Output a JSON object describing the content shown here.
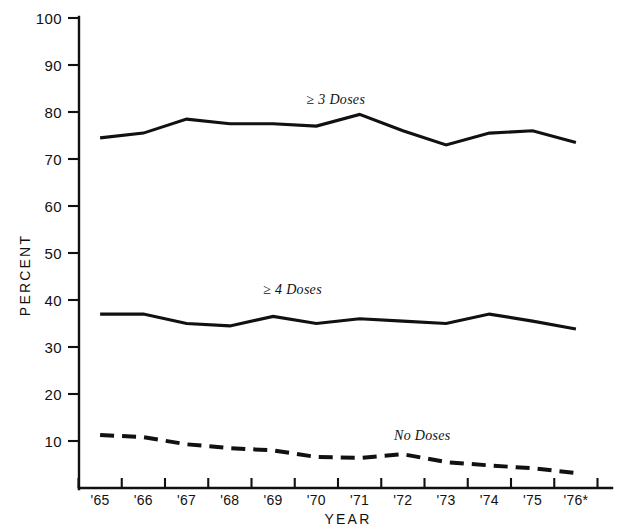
{
  "chart_data": {
    "type": "line",
    "title": "",
    "xlabel": "YEAR",
    "ylabel": "PERCENT",
    "ylim": [
      0,
      100
    ],
    "yticks": [
      0,
      10,
      20,
      30,
      40,
      50,
      60,
      70,
      80,
      90,
      100
    ],
    "ytick_labels": [
      "",
      "10",
      "20",
      "30",
      "40",
      "50",
      "60",
      "70",
      "80",
      "90",
      "100"
    ],
    "categories": [
      "'65",
      "'66",
      "'67",
      "'68",
      "'69",
      "'70",
      "'71",
      "'72",
      "'73",
      "'74",
      "'75",
      "'76*"
    ],
    "grid": false,
    "legend_position": "inline-annotations",
    "series": [
      {
        "name": "≥ 3 Doses",
        "style": "solid",
        "label_x_category": "'70",
        "values": [
          74.5,
          75.5,
          78.5,
          77.5,
          77.5,
          77.0,
          79.5,
          76.0,
          73.0,
          75.5,
          76.0,
          73.5
        ]
      },
      {
        "name": "≥ 4 Doses",
        "style": "solid",
        "label_x_category": "'69",
        "values": [
          37.0,
          37.0,
          35.0,
          34.5,
          36.5,
          35.0,
          36.0,
          35.5,
          35.0,
          37.0,
          35.5,
          33.8
        ]
      },
      {
        "name": "No Doses",
        "style": "dashed",
        "label_x_category": "'72",
        "values": [
          11.3,
          10.8,
          9.3,
          8.5,
          8.0,
          6.6,
          6.4,
          7.2,
          5.5,
          4.8,
          4.2,
          3.2
        ]
      }
    ]
  },
  "annotations": {
    "series1_label": "≥ 3 Doses",
    "series2_label": "≥ 4 Doses",
    "series3_label": "No Doses"
  },
  "axes": {
    "y_title": "PERCENT",
    "x_title": "YEAR",
    "y_100": "100",
    "y_90": "90",
    "y_80": "80",
    "y_70": "70",
    "y_60": "60",
    "y_50": "50",
    "y_40": "40",
    "y_30": "30",
    "y_20": "20",
    "y_10": "10",
    "x_65": "'65",
    "x_66": "'66",
    "x_67": "'67",
    "x_68": "'68",
    "x_69": "'69",
    "x_70": "'70",
    "x_71": "'71",
    "x_72": "'72",
    "x_73": "'73",
    "x_74": "'74",
    "x_75": "'75",
    "x_76": "'76*"
  }
}
